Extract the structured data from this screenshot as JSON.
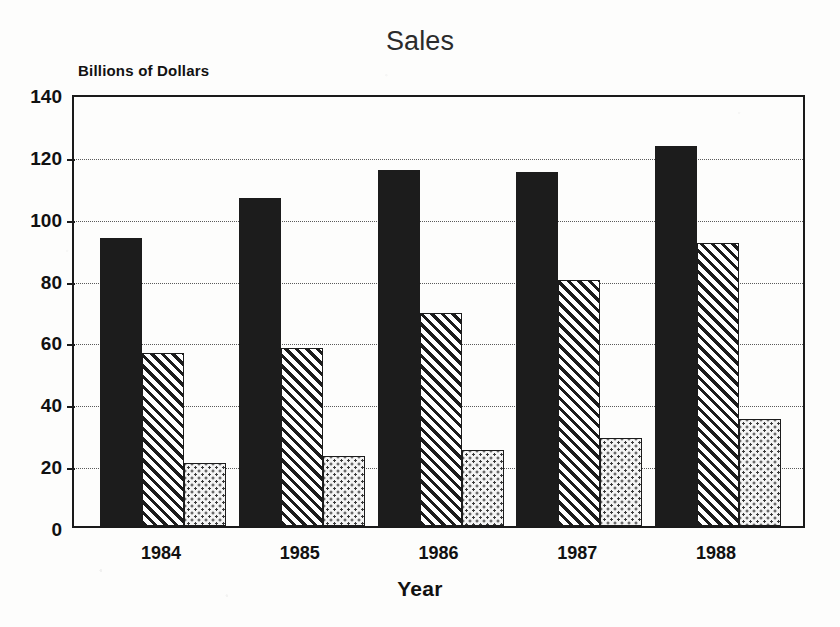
{
  "chart_data": {
    "type": "bar",
    "title": "Sales",
    "xlabel": "Year",
    "ylabel": "Billions of Dollars",
    "categories": [
      "1984",
      "1985",
      "1986",
      "1987",
      "1988"
    ],
    "series": [
      {
        "name": "series-1",
        "pattern": "solid-black",
        "values": [
          93,
          106,
          115,
          114.5,
          123
        ]
      },
      {
        "name": "series-2",
        "pattern": "diagonal-hatch",
        "values": [
          56,
          57.5,
          69,
          79.5,
          91.5
        ]
      },
      {
        "name": "series-3",
        "pattern": "dot-stipple",
        "values": [
          20.5,
          22.5,
          24.5,
          28.5,
          34.5
        ]
      }
    ],
    "ylim": [
      0,
      140
    ],
    "yticks": [
      0,
      20,
      40,
      60,
      80,
      100,
      120,
      140
    ],
    "ytick_labels": [
      "0",
      "20",
      "40",
      "60",
      "80",
      "100",
      "120",
      "140"
    ],
    "grid": true,
    "grid_axis": "y",
    "legend": "none",
    "colors": {
      "series_1": "#1c1c1c",
      "series_2_line": "#1c1c1c",
      "series_2_fill": "#ffffff",
      "series_3_dot": "#3a3a3a",
      "series_3_fill": "#f4f4f4",
      "axis": "#1a1a1a",
      "grid": "#5a5a5a",
      "background": "#fdfdfc",
      "title_text": "#2b2b2b",
      "label_text": "#111111"
    }
  }
}
